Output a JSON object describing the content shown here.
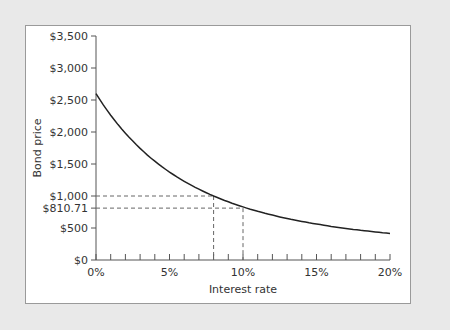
{
  "chart_data": {
    "type": "line",
    "title": "",
    "xlabel": "Interest rate",
    "ylabel": "Bond price",
    "x_ticks": [
      "0%",
      "5%",
      "10%",
      "15%",
      "20%"
    ],
    "y_ticks": [
      "$0",
      "$500",
      "$1,000",
      "$1,500",
      "$2,000",
      "$2,500",
      "$3,000",
      "$3,500"
    ],
    "xlim": [
      0,
      20
    ],
    "ylim": [
      0,
      3500
    ],
    "grid": false,
    "series": [
      {
        "name": "Bond price",
        "x": [
          0,
          1,
          2,
          3,
          4,
          5,
          6,
          7,
          8,
          9,
          10,
          11,
          12,
          13,
          14,
          15,
          16,
          17,
          18,
          19,
          20
        ],
        "values": [
          3400,
          2860,
          2428,
          2080,
          1797,
          1566,
          1376,
          1219,
          1000,
          900,
          810.71,
          739,
          680,
          630,
          588,
          553,
          523,
          497,
          475,
          456,
          440
        ]
      }
    ],
    "annotations": [
      {
        "label": "$1,000",
        "x": 8,
        "y": 1000,
        "style": "dashed"
      },
      {
        "label": "$810.71",
        "x": 10,
        "y": 810.71,
        "style": "dashed"
      }
    ]
  }
}
